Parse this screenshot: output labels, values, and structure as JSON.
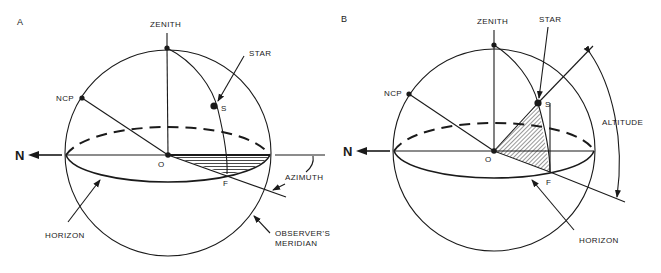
{
  "figure": {
    "panels": [
      {
        "id": "A",
        "panel_label": "A",
        "labels": {
          "zenith": "ZENITH",
          "star": "STAR",
          "ncp": "NCP",
          "star_point": "S",
          "origin": "O",
          "foot": "F",
          "north": "N",
          "azimuth": "AZIMUTH",
          "horizon": "HORIZON",
          "meridian_line1": "OBSERVER'S",
          "meridian_line2": "MERIDIAN"
        },
        "shaded_region": "azimuth angle (horizontal hatching, in horizon plane)"
      },
      {
        "id": "B",
        "panel_label": "B",
        "labels": {
          "zenith": "ZENITH",
          "star": "STAR",
          "ncp": "NCP",
          "star_point": "S",
          "origin": "O",
          "foot": "F",
          "north": "N",
          "altitude": "ALTITUDE",
          "horizon": "HORIZON"
        },
        "shaded_region": "altitude angle (diagonal hatching, vertical plane through star)"
      }
    ],
    "colors": {
      "ink": "#1a1a1a",
      "background": "#ffffff"
    }
  }
}
